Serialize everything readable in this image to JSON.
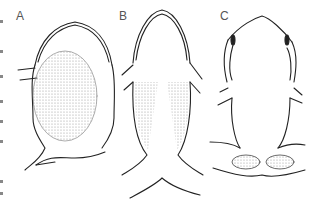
{
  "figure": {
    "panels": [
      {
        "label": "A",
        "description": "frog outline, ventral view, large stippled oval patch"
      },
      {
        "label": "B",
        "description": "frog outline, ventral view, paired stippled lateral patches"
      },
      {
        "label": "C",
        "description": "frog outline, dorsal view, two stippled oval glands near hindlimbs"
      }
    ],
    "colors": {
      "line": "#222222",
      "stipple": "#bbbbbb",
      "label": "#555555",
      "background": "#ffffff"
    }
  }
}
